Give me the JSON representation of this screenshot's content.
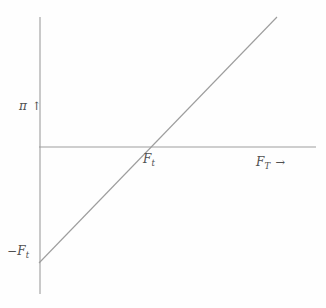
{
  "figure": {
    "background": "#fefefe",
    "line_color": "#9d9d9d",
    "text_color": "#4f4f4f"
  },
  "labels": {
    "y_symbol": "π",
    "y_arrow": "↑",
    "x_symbol": "F",
    "x_sub": "T",
    "x_arrow": "→",
    "x_intercept_symbol": "F",
    "x_intercept_sub": "t",
    "y_intercept_sign": "−",
    "y_intercept_symbol": "F",
    "y_intercept_sub": "t"
  },
  "chart_data": {
    "type": "line",
    "title": "",
    "xlabel": "F_T",
    "ylabel": "π",
    "slope": 1,
    "x_intercept_label": "F_t",
    "y_intercept_label": "−F_t",
    "grid": false,
    "axis_ticks": [],
    "geometry_px": {
      "y_axis": {
        "x1": 40,
        "y1": 17,
        "x2": 40,
        "y2": 294
      },
      "x_axis": {
        "x1": 39,
        "y1": 147,
        "x2": 316,
        "y2": 147
      },
      "payoff_line": {
        "x1": 39,
        "y1": 263,
        "x2": 277,
        "y2": 17
      }
    }
  }
}
